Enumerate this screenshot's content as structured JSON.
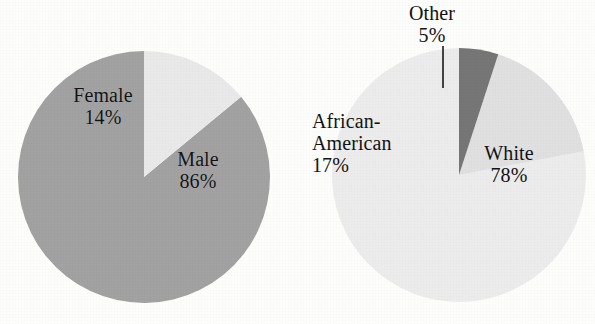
{
  "page": {
    "background_color": "#fdfdfc",
    "text_color": "#121212"
  },
  "chart_data": [
    {
      "type": "pie",
      "name": "gender-distribution",
      "title": "",
      "categories": [
        "Male",
        "Female"
      ],
      "values": [
        86,
        14
      ],
      "value_suffix": "%",
      "labels": [
        "Male\n86%",
        "Female\n14%"
      ],
      "colors": [
        "#a2a2a2",
        "#e9e9e9"
      ],
      "start_angle_deg": 90,
      "direction": "counterclockwise",
      "legend": "none",
      "grid": false,
      "geometry": {
        "cx": 144,
        "cy": 177,
        "r": 126
      },
      "slices": [
        {
          "label": "Male",
          "value": 86,
          "value_text": "86%",
          "color": "#a2a2a2"
        },
        {
          "label": "Female",
          "value": 14,
          "value_text": "14%",
          "color": "#e9e9e9"
        }
      ]
    },
    {
      "type": "pie",
      "name": "race-distribution",
      "title": "",
      "categories": [
        "White",
        "African-American",
        "Other"
      ],
      "values": [
        78,
        17,
        5
      ],
      "value_suffix": "%",
      "labels": [
        "White\n78%",
        "African-American\n17%",
        "Other\n5%"
      ],
      "colors": [
        "#ececec",
        "#e0e0e0",
        "#767676"
      ],
      "start_angle_deg": 90,
      "direction": "counterclockwise",
      "legend": "none",
      "grid": false,
      "geometry": {
        "cx": 161,
        "cy": 175,
        "r": 127
      },
      "annotations": [
        {
          "type": "leader-line",
          "for": "Other",
          "x": 145,
          "y1": 46,
          "y2": 88
        }
      ],
      "slices": [
        {
          "label": "White",
          "value": 78,
          "value_text": "78%",
          "color": "#ececec"
        },
        {
          "label": "African-American",
          "value": 17,
          "value_text": "17%",
          "color": "#e0e0e0"
        },
        {
          "label": "Other",
          "value": 5,
          "value_text": "5%",
          "color": "#767676"
        }
      ]
    }
  ],
  "gender_chart": {
    "male": {
      "name": "Male",
      "value": "86%"
    },
    "female": {
      "name": "Female",
      "value": "14%"
    }
  },
  "race_chart": {
    "white": {
      "name": "White",
      "value": "78%"
    },
    "african_american": {
      "name_line1": "African-",
      "name_line2": "American",
      "value": "17%"
    },
    "other": {
      "name": "Other",
      "value": "5%"
    }
  }
}
